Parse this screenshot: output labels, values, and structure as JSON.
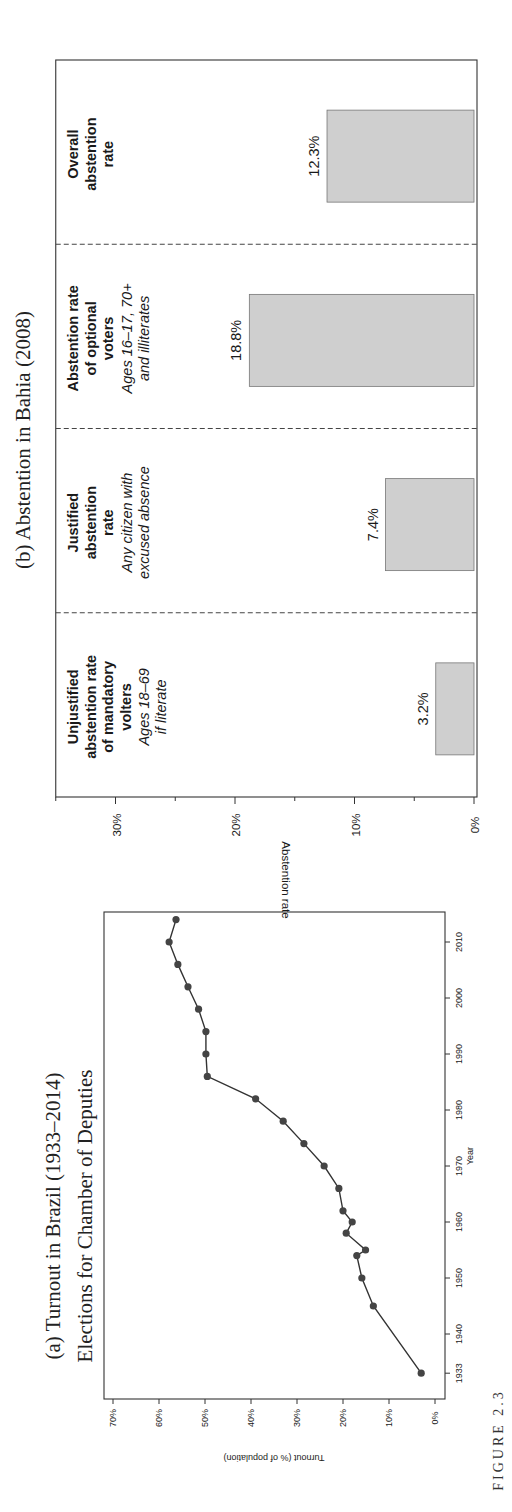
{
  "figure_label": "FIGURE 2.3",
  "chart_data": [
    {
      "id": "a",
      "type": "line",
      "title": "(a) Turnout in Brazil (1933–2014)",
      "subtitle": "Elections for Chamber of Deputies",
      "xlabel": "Year",
      "ylabel": "Turnout (% of population)",
      "xlim": [
        1931,
        2016
      ],
      "ylim": [
        0,
        70
      ],
      "x_ticks": [
        1933,
        1940,
        1950,
        1960,
        1970,
        1980,
        1990,
        2000,
        2010
      ],
      "y_ticks": [
        0,
        10,
        20,
        30,
        40,
        50,
        60,
        70
      ],
      "y_tick_labels": [
        "0%",
        "10%",
        "20%",
        "30%",
        "40%",
        "50%",
        "60%",
        "70%"
      ],
      "grid": false,
      "orientation": "rotated-90",
      "series": [
        {
          "name": "Turnout",
          "x": [
            1933,
            1945,
            1950,
            1954,
            1955,
            1958,
            1960,
            1962,
            1966,
            1970,
            1974,
            1978,
            1982,
            1986,
            1990,
            1994,
            1998,
            2002,
            2006,
            2010,
            2014
          ],
          "y": [
            3.0,
            13.4,
            15.9,
            17.0,
            15.1,
            19.3,
            18.0,
            20.0,
            20.9,
            24.1,
            28.5,
            33.0,
            39.0,
            49.5,
            49.8,
            49.8,
            51.4,
            53.7,
            55.9,
            57.8,
            56.3
          ]
        }
      ]
    },
    {
      "id": "b",
      "type": "bar",
      "title": "(b) Abstention in Bahia (2008)",
      "xlabel": "",
      "ylabel": "Abstention rate",
      "ylim": [
        0,
        35
      ],
      "y_ticks": [
        0,
        10,
        20,
        30
      ],
      "y_tick_labels": [
        "0%",
        "10%",
        "20%",
        "30%"
      ],
      "y_minor_ticks": [
        5,
        15,
        25
      ],
      "grid": false,
      "orientation": "rotated-90",
      "categories": [
        {
          "title_lines": [
            "Unjustified",
            "abstention rate",
            "of mandatory",
            "volters"
          ],
          "note_lines": [
            "Ages 18–69",
            "if literate"
          ]
        },
        {
          "title_lines": [
            "Justified",
            "abstention",
            "rate"
          ],
          "note_lines": [
            "Any citizen with",
            "excused absence"
          ]
        },
        {
          "title_lines": [
            "Abstention rate",
            "of optional",
            "voters"
          ],
          "note_lines": [
            "Ages 16–17, 70+",
            "and illiterates"
          ]
        },
        {
          "title_lines": [
            "Overall",
            "abstention",
            "rate"
          ],
          "note_lines": []
        }
      ],
      "values": [
        3.2,
        7.4,
        18.8,
        12.3
      ],
      "value_labels": [
        "3.2%",
        "7.4%",
        "18.8%",
        "12.3%"
      ],
      "bar_color": "#cfcfcf"
    }
  ]
}
